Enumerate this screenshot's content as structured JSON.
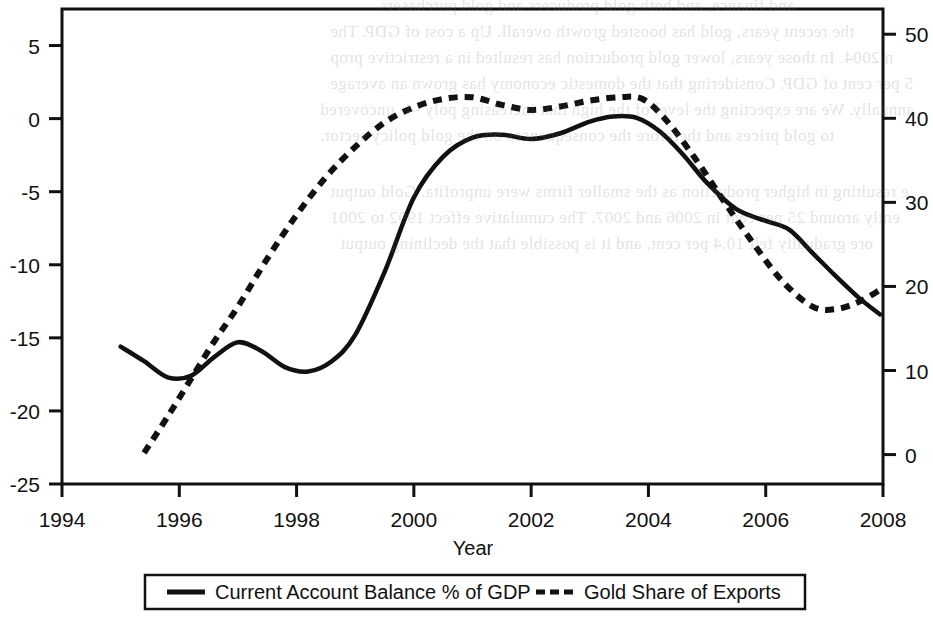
{
  "chart_data": {
    "type": "line",
    "title": "",
    "xlabel": "Year",
    "ylabel": "",
    "ylabel_right": "",
    "xlim": [
      1994,
      2008
    ],
    "xticks": [
      "1994",
      "1996",
      "1998",
      "2000",
      "2002",
      "2004",
      "2006",
      "2008"
    ],
    "xtick_values": [
      1994,
      1996,
      1998,
      2000,
      2002,
      2004,
      2006,
      2008
    ],
    "ylim": [
      -25,
      7.5
    ],
    "yticks": [
      "5",
      "0",
      "-5",
      "-10",
      "-15",
      "-20",
      "-25"
    ],
    "ytick_values": [
      5,
      0,
      -5,
      -10,
      -15,
      -20,
      -25
    ],
    "ylim_right": [
      -3.5,
      53
    ],
    "yticks_right": [
      "50",
      "40",
      "30",
      "20",
      "10",
      "0"
    ],
    "ytick_values_right": [
      50,
      40,
      30,
      20,
      10,
      0
    ],
    "grid": false,
    "legend_position": "below-axes",
    "series": [
      {
        "name": "Current Account Balance % of GDP",
        "axis": "left",
        "style": "solid",
        "color": "#111111",
        "x": [
          1995.0,
          1995.4,
          1995.8,
          1996.2,
          1996.6,
          1997.0,
          1997.4,
          1997.8,
          1998.2,
          1998.6,
          1999.0,
          1999.5,
          2000.0,
          2000.5,
          2001.0,
          2001.5,
          2002.0,
          2002.5,
          2003.0,
          2003.4,
          2003.8,
          2004.2,
          2004.6,
          2005.0,
          2005.5,
          2006.0,
          2006.4,
          2006.8,
          2007.2,
          2007.6,
          2007.95
        ],
        "y": [
          -15.6,
          -16.6,
          -17.7,
          -17.6,
          -16.3,
          -15.3,
          -15.9,
          -17.0,
          -17.3,
          -16.6,
          -14.8,
          -10.5,
          -5.4,
          -2.6,
          -1.3,
          -1.1,
          -1.4,
          -1.0,
          -0.2,
          0.15,
          0.05,
          -0.9,
          -2.5,
          -4.4,
          -6.2,
          -7.0,
          -7.6,
          -9.2,
          -10.8,
          -12.3,
          -13.4
        ]
      },
      {
        "name": "Gold Share of Exports",
        "axis": "right",
        "style": "dashed",
        "color": "#111111",
        "x": [
          1995.4,
          1995.8,
          1996.2,
          1996.6,
          1997.0,
          1997.5,
          1998.0,
          1998.5,
          1999.0,
          1999.5,
          2000.0,
          2000.5,
          2001.0,
          2001.5,
          2002.0,
          2002.5,
          2003.0,
          2003.5,
          2003.9,
          2004.3,
          2004.8,
          2005.3,
          2005.8,
          2006.3,
          2006.8,
          2007.2,
          2007.6,
          2007.95
        ],
        "y": [
          0.2,
          4.5,
          9.0,
          13.5,
          17.6,
          23.3,
          28.5,
          33.0,
          36.6,
          39.5,
          41.3,
          42.3,
          42.5,
          41.6,
          41.0,
          41.4,
          42.1,
          42.5,
          42.3,
          39.8,
          35.2,
          30.0,
          25.0,
          20.5,
          17.6,
          17.3,
          18.2,
          19.6
        ]
      }
    ],
    "legend": [
      {
        "label": "Current Account Balance % of GDP",
        "style": "solid"
      },
      {
        "label": "Gold Share of Exports",
        "style": "dashed"
      }
    ]
  },
  "bleed_text": {
    "lines": [
      "and finance, and both gold producers and gold purchasers",
      "the recent years, gold has boosted growth overall. Up a cost of GDP. The",
      "n 2004. In those years, lower gold production has resulted in a restrictive prop",
      "5 per cent of GDP. Considering that the domestic economy has grown an average",
      "annually. We are expecting the level of the high that increasing poly -4-    uncovered",
      "to gold prices and therefore the consequences on the gold policy sector.",
      "e resulting in higher production as the smaller firms were unprofita. Gold output",
      "ently around 25 per cent in 2006 and 2007. The cumulative effect 1992 to 2001",
      "ore gradually felt 10.4 per cent, and it is possible that the declining output"
    ]
  }
}
